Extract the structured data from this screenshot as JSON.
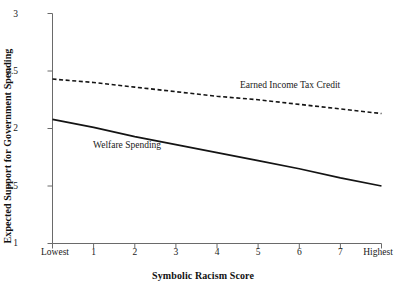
{
  "chart_data": {
    "type": "line",
    "title": "",
    "xlabel": "Symbolic Racism Score",
    "ylabel": "Expected Support for Government Spending",
    "xtick_labels": [
      "Lowest",
      "1",
      "2",
      "3",
      "4",
      "5",
      "6",
      "7",
      "Highest"
    ],
    "ytick_labels": [
      "1",
      "1.5",
      "2",
      "2.5",
      "3"
    ],
    "ytick_values": [
      1,
      1.5,
      2,
      2.5,
      3
    ],
    "ylim": [
      1,
      3
    ],
    "xlim": [
      0,
      8
    ],
    "grid": false,
    "legend_position": "inline-annotations",
    "series": [
      {
        "name": "Earned Income Tax Credit",
        "style": "dashed",
        "color": "#141414",
        "x": [
          0,
          1,
          2,
          3,
          4,
          5,
          6,
          7,
          8
        ],
        "values": [
          2.43,
          2.4,
          2.36,
          2.32,
          2.28,
          2.25,
          2.21,
          2.17,
          2.13
        ]
      },
      {
        "name": "Welfare Spending",
        "style": "solid",
        "color": "#141414",
        "x": [
          0,
          1,
          2,
          3,
          4,
          5,
          6,
          7,
          8
        ],
        "values": [
          2.08,
          2.01,
          1.93,
          1.86,
          1.79,
          1.72,
          1.65,
          1.57,
          1.5
        ]
      }
    ],
    "annotations": [
      {
        "text": "Earned Income Tax Credit",
        "series": "Earned Income Tax Credit"
      },
      {
        "text": "Welfare Spending",
        "series": "Welfare Spending"
      }
    ]
  },
  "axes": {
    "line_color": "#5a5a5a"
  }
}
